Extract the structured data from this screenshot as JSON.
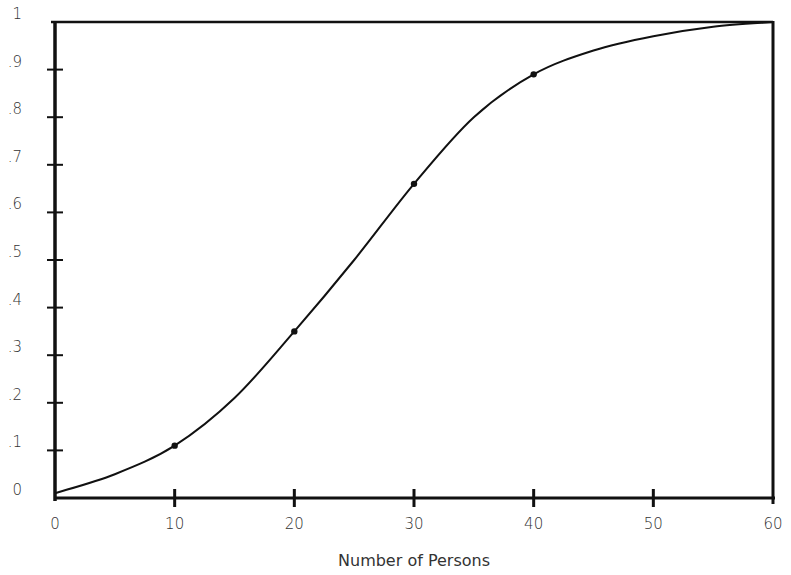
{
  "chart_data": {
    "type": "line",
    "title": "",
    "xlabel": "Number of Persons",
    "ylabel": "",
    "xlim": [
      0,
      60
    ],
    "ylim": [
      0,
      1
    ],
    "grid": false,
    "legend": null,
    "x_ticks": [
      "0",
      "10",
      "20",
      "30",
      "40",
      "50",
      "60"
    ],
    "y_ticks": [
      "0",
      ".1",
      ".2",
      ".3",
      ".4",
      ".5",
      ".6",
      ".7",
      ".8",
      ".9",
      "1"
    ],
    "series": [
      {
        "name": "cumulative probability",
        "curve": {
          "x": [
            0,
            5,
            10,
            15,
            20,
            25,
            30,
            35,
            40,
            45,
            50,
            55,
            60
          ],
          "y": [
            0.01,
            0.05,
            0.11,
            0.21,
            0.35,
            0.5,
            0.66,
            0.8,
            0.89,
            0.94,
            0.97,
            0.99,
            1.0
          ]
        },
        "marked_points": {
          "x": [
            10,
            20,
            30,
            40
          ],
          "y": [
            0.11,
            0.35,
            0.66,
            0.89
          ]
        }
      }
    ]
  },
  "labels": {
    "xlabel": "Number of Persons"
  }
}
